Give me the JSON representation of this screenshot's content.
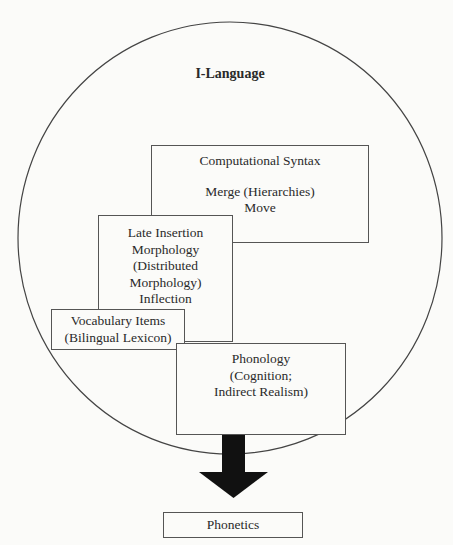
{
  "diagram": {
    "container": {
      "label": "I-Language",
      "shape": "circle"
    },
    "boxes": {
      "syntax": {
        "title": "Computational Syntax",
        "lines": [
          "Merge (Hierarchies)",
          "Move"
        ]
      },
      "morphology": {
        "lines": [
          "Late Insertion",
          "Morphology",
          "(Distributed",
          "Morphology)",
          "Inflection"
        ]
      },
      "vocabulary": {
        "lines": [
          "Vocabulary Items",
          "(Bilingual Lexicon)"
        ]
      },
      "phonology": {
        "lines": [
          "Phonology",
          "(Cognition;",
          "Indirect Realism)"
        ]
      },
      "phonetics": {
        "label": "Phonetics"
      }
    },
    "arrow": {
      "from": "Phonology (Cognition; Indirect Realism)",
      "to": "Phonetics",
      "color": "#111111"
    },
    "colors": {
      "line": "#555555",
      "background": "#fbfbf9",
      "arrow": "#111111"
    }
  }
}
